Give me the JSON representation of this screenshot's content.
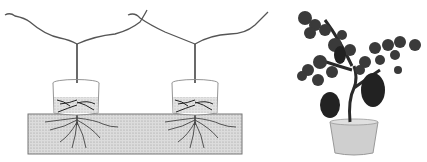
{
  "figure": {
    "left_panel": {
      "description": "Line drawing of two grapevine cuttings, each rooted in a cup of soil placed on a soil bed, with roots growing down into the bed",
      "plants": 2,
      "colors": {
        "stem": "#555555",
        "soil_fill": "#d0d0d0",
        "soil_border": "#777777",
        "cup_border": "#888888",
        "root": "#333333"
      }
    },
    "right_panel": {
      "description": "Grayscale photo of potted grapevine bonsai with grape clusters",
      "colors": {
        "leaf": "#3a3a3a",
        "grape": "#2a2a2a",
        "pot": "#cfcfcf"
      }
    }
  }
}
